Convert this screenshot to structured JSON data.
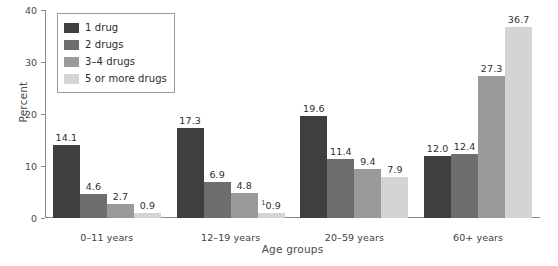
{
  "chart_data": {
    "type": "bar",
    "title": "",
    "subtitle": "",
    "xlabel": "Age groups",
    "ylabel": "Percent",
    "categories": [
      "0–11 years",
      "12–19 years",
      "20–59 years",
      "60+ years"
    ],
    "series": [
      {
        "name": "1 drug",
        "color": "#3f3f3f",
        "values": [
          14.1,
          17.3,
          19.6,
          12.0
        ]
      },
      {
        "name": "2 drugs",
        "color": "#6e6e6e",
        "values": [
          4.6,
          6.9,
          11.4,
          12.4
        ]
      },
      {
        "name": "3–4 drugs",
        "color": "#9a9a9a",
        "values": [
          2.7,
          4.8,
          9.4,
          27.3
        ]
      },
      {
        "name": "5 or more drugs",
        "color": "#d4d4d4",
        "values": [
          0.9,
          0.9,
          7.9,
          36.7
        ]
      }
    ],
    "value_labels": [
      [
        "14.1",
        "4.6",
        "2.7",
        "0.9"
      ],
      [
        "17.3",
        "6.9",
        "4.8",
        "0.9"
      ],
      [
        "19.6",
        "11.4",
        "9.4",
        "7.9"
      ],
      [
        "12.0",
        "12.4",
        "27.3",
        "36.7"
      ]
    ],
    "footnote_markers": [
      [
        "",
        "",
        "",
        ""
      ],
      [
        "",
        "",
        "",
        "1"
      ],
      [
        "",
        "",
        "",
        ""
      ],
      [
        "",
        "",
        "",
        ""
      ]
    ],
    "ylim": [
      0,
      40
    ],
    "yticks": [
      0,
      10,
      20,
      30,
      40
    ],
    "ytick_labels": [
      "0",
      "10",
      "20",
      "30",
      "40"
    ],
    "grid": false,
    "legend_position": "upper-left"
  },
  "legend": {
    "items": [
      {
        "label": "1 drug",
        "color": "#3f3f3f"
      },
      {
        "label": "2 drugs",
        "color": "#6e6e6e"
      },
      {
        "label": "3–4 drugs",
        "color": "#9a9a9a"
      },
      {
        "label": "5 or more drugs",
        "color": "#d4d4d4"
      }
    ]
  }
}
